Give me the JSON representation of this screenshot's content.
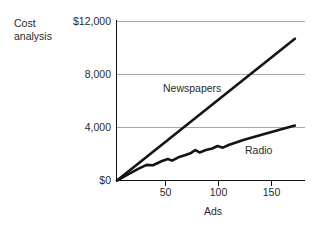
{
  "figure": {
    "title_line1": "Cost",
    "title_line2": "analysis",
    "title": "Cost analysis"
  },
  "chart_data": {
    "type": "line",
    "title": "Cost analysis",
    "xlabel": "Ads",
    "ylabel": "",
    "xlim": [
      0,
      170
    ],
    "ylim": [
      0,
      12000
    ],
    "grid": true,
    "grid_axis": "y",
    "legend": "inline-labels",
    "x_ticks": [
      50,
      100,
      150
    ],
    "x_tick_labels": [
      "50",
      "100",
      "150"
    ],
    "y_ticks": [
      0,
      4000,
      8000,
      12000
    ],
    "y_tick_labels": [
      "$0",
      "4,000",
      "8,000",
      "$12,000"
    ],
    "series": [
      {
        "name": "Newspapers",
        "label": "Newspapers",
        "color": "#141414",
        "x": [
          0,
          168
        ],
        "values": [
          0,
          10700
        ]
      },
      {
        "name": "Radio",
        "label": "Radio",
        "color": "#141414",
        "x": [
          0,
          10,
          20,
          28,
          34,
          42,
          48,
          52,
          58,
          64,
          70,
          74,
          78,
          84,
          90,
          95,
          100,
          106,
          120,
          140,
          168
        ],
        "values": [
          0,
          440,
          880,
          1180,
          1150,
          1450,
          1620,
          1500,
          1750,
          1900,
          2080,
          2300,
          2120,
          2300,
          2420,
          2600,
          2480,
          2700,
          3080,
          3520,
          4150
        ]
      }
    ]
  },
  "axis_titles": {
    "x": "Ads"
  },
  "colors": {
    "background": "#ffffff",
    "axis": "#111111",
    "gridline": "#a8a8a8",
    "series": "#141414",
    "text": "#2a2a2a"
  }
}
